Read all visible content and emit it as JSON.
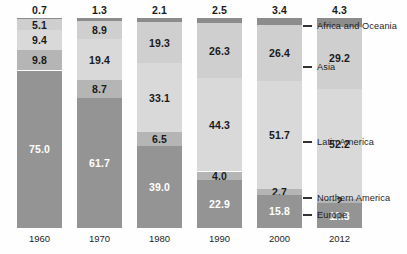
{
  "chart_data": {
    "type": "bar",
    "subtype": "stacked-bar-100",
    "title": "",
    "xlabel": "",
    "ylabel": "",
    "ylim": [
      0,
      100
    ],
    "grid": false,
    "legend_position": "right",
    "categories": [
      "1960",
      "1970",
      "1980",
      "1990",
      "2000",
      "2012"
    ],
    "series": [
      {
        "name": "Africa and Oceania",
        "color": "#8c8c8c",
        "values": [
          0.7,
          1.3,
          2.1,
          2.5,
          3.4,
          4.3
        ],
        "labels": [
          "0.7",
          "1.3",
          "2.1",
          "2.5",
          "3.4",
          "4.3"
        ],
        "label_position": "above-bar"
      },
      {
        "name": "Asia",
        "color": "#cfcfcf",
        "values": [
          5.1,
          8.9,
          19.3,
          26.3,
          26.4,
          29.2
        ],
        "labels": [
          "5.1",
          "8.9",
          "19.3",
          "26.3",
          "26.4",
          "29.2"
        ],
        "label_position": "inside"
      },
      {
        "name": "Latin America",
        "color": "#d9d9d9",
        "values": [
          9.4,
          19.4,
          33.1,
          44.3,
          51.7,
          52.2
        ],
        "labels": [
          "9.4",
          "19.4",
          "33.1",
          "44.3",
          "51.7",
          "52.2"
        ],
        "label_position": "inside"
      },
      {
        "name": "Northern America",
        "color": "#b5b5b5",
        "values": [
          9.8,
          8.7,
          6.5,
          4.0,
          2.7,
          2.0
        ],
        "labels": [
          "9.8",
          "8.7",
          "6.5",
          "4.0",
          "2.7",
          "2"
        ],
        "label_position": "inside"
      },
      {
        "name": "Europe",
        "color": "#949494",
        "values": [
          75.0,
          61.7,
          39.0,
          22.9,
          15.8,
          11.8
        ],
        "labels": [
          "75.0",
          "61.7",
          "39.0",
          "22.9",
          "15.8",
          "11.8"
        ],
        "label_position": "inside"
      }
    ]
  },
  "bars": [
    {
      "year": "1960",
      "total_label": "0.7",
      "segments": [
        {
          "name": "Africa and Oceania",
          "label": "0.7",
          "value": 0.7,
          "color": "#8c8c8c",
          "text_color": "#1a1a1a",
          "show_label": false
        },
        {
          "name": "Asia",
          "label": "5.1",
          "value": 5.1,
          "color": "#cfcfcf",
          "text_color": "#1a1a1a",
          "show_label": true
        },
        {
          "name": "Latin America",
          "label": "9.4",
          "value": 9.4,
          "color": "#d9d9d9",
          "text_color": "#1a1a1a",
          "show_label": true
        },
        {
          "name": "Northern America",
          "label": "9.8",
          "value": 9.8,
          "color": "#b5b5b5",
          "text_color": "#1a1a1a",
          "show_label": true
        },
        {
          "name": "Europe",
          "label": "75.0",
          "value": 75.0,
          "color": "#949494",
          "text_color": "#ffffff",
          "show_label": true
        }
      ]
    },
    {
      "year": "1970",
      "total_label": "1.3",
      "segments": [
        {
          "name": "Africa and Oceania",
          "label": "1.3",
          "value": 1.3,
          "color": "#8c8c8c",
          "text_color": "#1a1a1a",
          "show_label": false
        },
        {
          "name": "Asia",
          "label": "8.9",
          "value": 8.9,
          "color": "#cfcfcf",
          "text_color": "#1a1a1a",
          "show_label": true
        },
        {
          "name": "Latin America",
          "label": "19.4",
          "value": 19.4,
          "color": "#d9d9d9",
          "text_color": "#1a1a1a",
          "show_label": true
        },
        {
          "name": "Northern America",
          "label": "8.7",
          "value": 8.7,
          "color": "#b5b5b5",
          "text_color": "#1a1a1a",
          "show_label": true
        },
        {
          "name": "Europe",
          "label": "61.7",
          "value": 61.7,
          "color": "#949494",
          "text_color": "#ffffff",
          "show_label": true
        }
      ]
    },
    {
      "year": "1980",
      "total_label": "2.1",
      "segments": [
        {
          "name": "Africa and Oceania",
          "label": "2.1",
          "value": 2.1,
          "color": "#8c8c8c",
          "text_color": "#1a1a1a",
          "show_label": false
        },
        {
          "name": "Asia",
          "label": "19.3",
          "value": 19.3,
          "color": "#cfcfcf",
          "text_color": "#1a1a1a",
          "show_label": true
        },
        {
          "name": "Latin America",
          "label": "33.1",
          "value": 33.1,
          "color": "#d9d9d9",
          "text_color": "#1a1a1a",
          "show_label": true
        },
        {
          "name": "Northern America",
          "label": "6.5",
          "value": 6.5,
          "color": "#b5b5b5",
          "text_color": "#1a1a1a",
          "show_label": true
        },
        {
          "name": "Europe",
          "label": "39.0",
          "value": 39.0,
          "color": "#949494",
          "text_color": "#ffffff",
          "show_label": true
        }
      ]
    },
    {
      "year": "1990",
      "total_label": "2.5",
      "segments": [
        {
          "name": "Africa and Oceania",
          "label": "2.5",
          "value": 2.5,
          "color": "#8c8c8c",
          "text_color": "#1a1a1a",
          "show_label": false
        },
        {
          "name": "Asia",
          "label": "26.3",
          "value": 26.3,
          "color": "#cfcfcf",
          "text_color": "#1a1a1a",
          "show_label": true
        },
        {
          "name": "Latin America",
          "label": "44.3",
          "value": 44.3,
          "color": "#d9d9d9",
          "text_color": "#1a1a1a",
          "show_label": true
        },
        {
          "name": "Northern America",
          "label": "4.0",
          "value": 4.0,
          "color": "#b5b5b5",
          "text_color": "#1a1a1a",
          "show_label": true
        },
        {
          "name": "Europe",
          "label": "22.9",
          "value": 22.9,
          "color": "#949494",
          "text_color": "#ffffff",
          "show_label": true
        }
      ]
    },
    {
      "year": "2000",
      "total_label": "3.4",
      "segments": [
        {
          "name": "Africa and Oceania",
          "label": "3.4",
          "value": 3.4,
          "color": "#8c8c8c",
          "text_color": "#1a1a1a",
          "show_label": false
        },
        {
          "name": "Asia",
          "label": "26.4",
          "value": 26.4,
          "color": "#cfcfcf",
          "text_color": "#1a1a1a",
          "show_label": true
        },
        {
          "name": "Latin America",
          "label": "51.7",
          "value": 51.7,
          "color": "#d9d9d9",
          "text_color": "#1a1a1a",
          "show_label": true
        },
        {
          "name": "Northern America",
          "label": "2.7",
          "value": 2.7,
          "color": "#b5b5b5",
          "text_color": "#1a1a1a",
          "show_label": true
        },
        {
          "name": "Europe",
          "label": "15.8",
          "value": 15.8,
          "color": "#949494",
          "text_color": "#ffffff",
          "show_label": true
        }
      ]
    },
    {
      "year": "2012",
      "total_label": "4.3",
      "segments": [
        {
          "name": "Africa and Oceania",
          "label": "4.3",
          "value": 4.3,
          "color": "#8c8c8c",
          "text_color": "#1a1a1a",
          "show_label": false
        },
        {
          "name": "Asia",
          "label": "29.2",
          "value": 29.2,
          "color": "#cfcfcf",
          "text_color": "#1a1a1a",
          "show_label": true
        },
        {
          "name": "Latin America",
          "label": "52.2",
          "value": 52.2,
          "color": "#d9d9d9",
          "text_color": "#1a1a1a",
          "show_label": true
        },
        {
          "name": "Northern America",
          "label": "2",
          "value": 2.0,
          "color": "#b5b5b5",
          "text_color": "#1a1a1a",
          "show_label": true
        },
        {
          "name": "Europe",
          "label": "11.8",
          "value": 11.8,
          "color": "#949494",
          "text_color": "#ffffff",
          "show_label": true
        }
      ]
    }
  ],
  "legend": [
    {
      "label": "Africa and Oceania",
      "y": 27,
      "color": "#8c8c8c"
    },
    {
      "label": "Asia",
      "y": 68,
      "color": "#cfcfcf"
    },
    {
      "label": "Latin America",
      "y": 143,
      "color": "#d9d9d9"
    },
    {
      "label": "Northern America",
      "y": 199,
      "color": "#b5b5b5"
    },
    {
      "label": "Europe",
      "y": 216,
      "color": "#949494"
    }
  ]
}
